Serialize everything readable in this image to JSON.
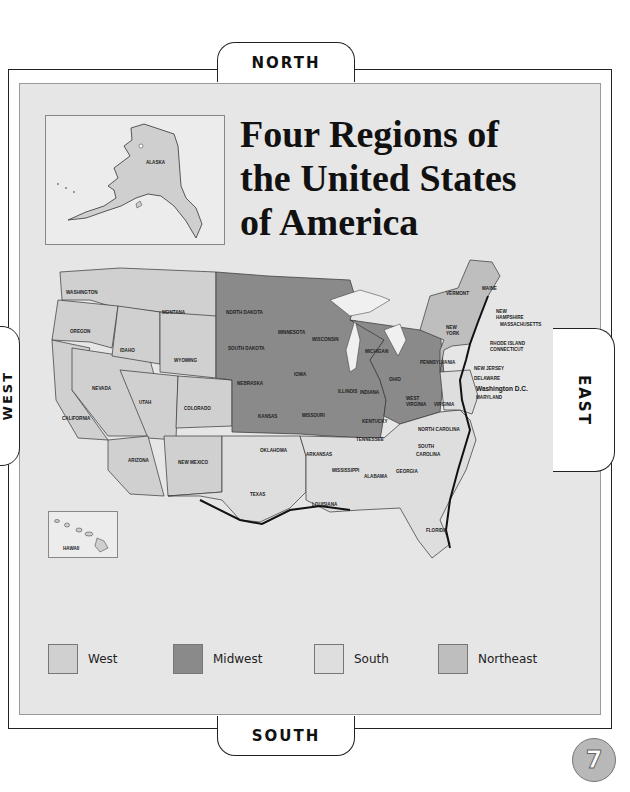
{
  "title": {
    "line1": "Four Regions of",
    "line2": "the United States",
    "line3": "of America"
  },
  "compass": {
    "north": "NORTH",
    "south": "SOUTH",
    "east": "EAST",
    "west": "WEST"
  },
  "insets": {
    "alaska": "ALASKA",
    "hawaii": "HAWAII"
  },
  "colors": {
    "west": "#d2d2d2",
    "midwest": "#8c8c8c",
    "south": "#dcdcdc",
    "northeast": "#bcbcbc",
    "background": "#e6e6e6"
  },
  "legend": [
    {
      "label": "West",
      "color": "#d0d0d0"
    },
    {
      "label": "Midwest",
      "color": "#8a8a8a"
    },
    {
      "label": "South",
      "color": "#dedede"
    },
    {
      "label": "Northeast",
      "color": "#bebebe"
    }
  ],
  "states": {
    "west": [
      "WASHINGTON",
      "OREGON",
      "CALIFORNIA",
      "IDAHO",
      "NEVADA",
      "MONTANA",
      "WYOMING",
      "UTAH",
      "COLORADO",
      "ARIZONA",
      "NEW MEXICO"
    ],
    "midwest": [
      "NORTH DAKOTA",
      "SOUTH DAKOTA",
      "NEBRASKA",
      "KANSAS",
      "MINNESOTA",
      "IOWA",
      "MISSOURI",
      "WISCONSIN",
      "ILLINOIS",
      "MICHIGAN",
      "INDIANA",
      "OHIO"
    ],
    "south": [
      "OKLAHOMA",
      "TEXAS",
      "ARKANSAS",
      "LOUISIANA",
      "MISSISSIPPI",
      "ALABAMA",
      "TENNESSEE",
      "KENTUCKY",
      "GEORGIA",
      "FLORIDA",
      "SOUTH CAROLINA",
      "NORTH CAROLINA",
      "VIRGINIA",
      "WEST VIRGINIA",
      "MARYLAND",
      "DELAWARE"
    ],
    "northeast": [
      "MAINE",
      "VERMONT",
      "NEW HAMPSHIRE",
      "MASSACHUSETTS",
      "RHODE ISLAND",
      "CONNECTICUT",
      "NEW YORK",
      "PENNSYLVANIA",
      "NEW JERSEY"
    ]
  },
  "labels": {
    "washington": "WASHINGTON",
    "oregon": "OREGON",
    "california": "CALIFORNIA",
    "idaho": "IDAHO",
    "nevada": "NEVADA",
    "montana": "MONTANA",
    "wyoming": "WYOMING",
    "utah": "UTAH",
    "colorado": "COLORADO",
    "arizona": "ARIZONA",
    "new_mexico": "NEW MEXICO",
    "north_dakota": "NORTH DAKOTA",
    "south_dakota": "SOUTH DAKOTA",
    "nebraska": "NEBRASKA",
    "kansas": "KANSAS",
    "minnesota": "MINNESOTA",
    "iowa": "IOWA",
    "missouri": "MISSOURI",
    "wisconsin": "WISCONSIN",
    "illinois": "ILLINOIS",
    "michigan": "MICHIGAN",
    "indiana": "INDIANA",
    "ohio": "OHIO",
    "oklahoma": "OKLAHOMA",
    "texas": "TEXAS",
    "arkansas": "ARKANSAS",
    "louisiana": "LOUISIANA",
    "mississippi": "MISSISSIPPI",
    "alabama": "ALABAMA",
    "tennessee": "TENNESSEE",
    "kentucky": "KENTUCKY",
    "georgia": "GEORGIA",
    "florida": "FLORIDA",
    "south_carolina_1": "SOUTH",
    "south_carolina_2": "CAROLINA",
    "north_carolina": "NORTH CAROLINA",
    "virginia": "VIRGINIA",
    "west_virginia_1": "WEST",
    "west_virginia_2": "VIRGINIA",
    "maryland": "MARYLAND",
    "delaware": "DELAWARE",
    "washington_dc": "Washington D.C.",
    "maine": "MAINE",
    "vermont": "VERMONT",
    "new_hampshire_1": "NEW",
    "new_hampshire_2": "HAMPSHIRE",
    "massachusetts": "MASSACHUSETTS",
    "rhode_island": "RHODE ISLAND",
    "connecticut": "CONNECTICUT",
    "new_york_1": "NEW",
    "new_york_2": "YORK",
    "pennsylvania": "PENNSYLVANIA",
    "new_jersey": "NEW JERSEY"
  },
  "page_number": "7"
}
